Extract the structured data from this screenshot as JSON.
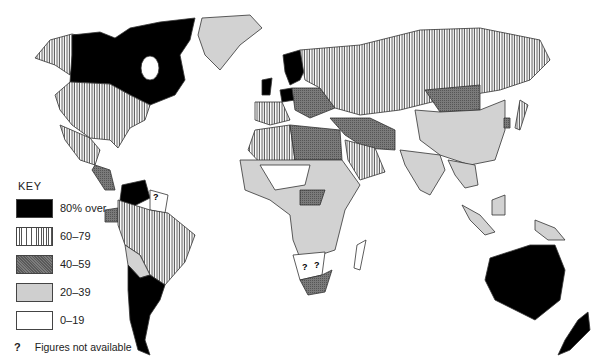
{
  "map": {
    "subject": "World choropleth map by percentage band",
    "key": {
      "title": "KEY",
      "items": [
        {
          "label": "80% over",
          "pattern": "solid-black",
          "color": "#000000"
        },
        {
          "label": "60–79",
          "pattern": "vertical-stripes",
          "color": "#555555"
        },
        {
          "label": "40–59",
          "pattern": "dark-stipple",
          "color": "#6d6d6d"
        },
        {
          "label": "20–39",
          "pattern": "light-grey",
          "color": "#cfcfcf"
        },
        {
          "label": "0–19",
          "pattern": "white",
          "color": "#ffffff"
        }
      ],
      "not_available": {
        "symbol": "?",
        "label": "Figures not available"
      }
    },
    "regions": [
      {
        "name": "Canada",
        "band": "80% over"
      },
      {
        "name": "USA",
        "band": "60–79"
      },
      {
        "name": "Alaska",
        "band": "60–79"
      },
      {
        "name": "Greenland",
        "band": "20–39"
      },
      {
        "name": "Mexico",
        "band": "60–79"
      },
      {
        "name": "Central America",
        "band": "40–59"
      },
      {
        "name": "Venezuela",
        "band": "80% over"
      },
      {
        "name": "Guianas",
        "band": "Figures not available"
      },
      {
        "name": "Brazil",
        "band": "60–79"
      },
      {
        "name": "Colombia/Peru",
        "band": "60–79"
      },
      {
        "name": "Ecuador",
        "band": "40–59"
      },
      {
        "name": "Bolivia/Paraguay",
        "band": "20–39"
      },
      {
        "name": "Argentina/Chile/Uruguay",
        "band": "80% over"
      },
      {
        "name": "UK",
        "band": "80% over"
      },
      {
        "name": "Scandinavia",
        "band": "80% over"
      },
      {
        "name": "West Germany/Benelux",
        "band": "80% over"
      },
      {
        "name": "France/Iberia",
        "band": "60–79"
      },
      {
        "name": "Eastern Europe",
        "band": "40–59"
      },
      {
        "name": "USSR",
        "band": "60–79"
      },
      {
        "name": "North Africa (Libya/Egypt)",
        "band": "40–59"
      },
      {
        "name": "Algeria",
        "band": "60–79"
      },
      {
        "name": "Saudi Arabia",
        "band": "60–79"
      },
      {
        "name": "Iran/Iraq",
        "band": "40–59"
      },
      {
        "name": "Sub-Saharan Africa",
        "band": "20–39"
      },
      {
        "name": "Botswana/Namibia",
        "band": "Figures not available"
      },
      {
        "name": "South Africa",
        "band": "40–59"
      },
      {
        "name": "Mongolia",
        "band": "40–59"
      },
      {
        "name": "China",
        "band": "20–39"
      },
      {
        "name": "India",
        "band": "20–39"
      },
      {
        "name": "Japan",
        "band": "60–79"
      },
      {
        "name": "South Korea",
        "band": "40–59"
      },
      {
        "name": "Indonesia",
        "band": "20–39"
      },
      {
        "name": "Australia",
        "band": "80% over"
      },
      {
        "name": "New Zealand",
        "band": "80% over"
      }
    ]
  }
}
